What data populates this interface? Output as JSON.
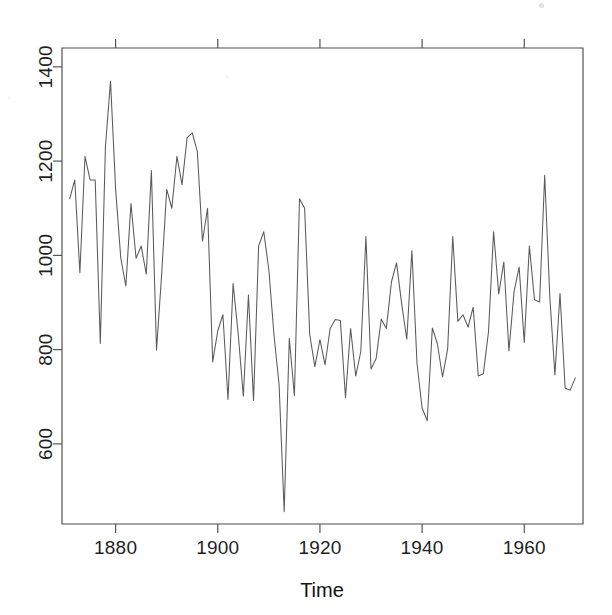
{
  "figure": {
    "background_color": "#ffffff",
    "line_color": "#5a5a5a",
    "axis_color": "#4d4d4d",
    "text_color": "#1a1a1a"
  },
  "chart_data": {
    "type": "line",
    "title": "",
    "subtitle": "",
    "xlabel": "Time",
    "ylabel": "",
    "xlim": [
      1869.5,
      1971.5
    ],
    "ylim": [
      430,
      1440
    ],
    "grid": false,
    "legend": false,
    "legend_position": "none",
    "xticks": [
      1880,
      1900,
      1920,
      1940,
      1960
    ],
    "xtick_labels": [
      "1880",
      "1900",
      "1920",
      "1940",
      "1960"
    ],
    "yticks": [
      600,
      800,
      1000,
      1200,
      1400
    ],
    "ytick_labels": [
      "600",
      "800",
      "1000",
      "1200",
      "1400"
    ],
    "series_name": "Nile annual flow",
    "x": [
      1871,
      1872,
      1873,
      1874,
      1875,
      1876,
      1877,
      1878,
      1879,
      1880,
      1881,
      1882,
      1883,
      1884,
      1885,
      1886,
      1887,
      1888,
      1889,
      1890,
      1891,
      1892,
      1893,
      1894,
      1895,
      1896,
      1897,
      1898,
      1899,
      1900,
      1901,
      1902,
      1903,
      1904,
      1905,
      1906,
      1907,
      1908,
      1909,
      1910,
      1911,
      1912,
      1913,
      1914,
      1915,
      1916,
      1917,
      1918,
      1919,
      1920,
      1921,
      1922,
      1923,
      1924,
      1925,
      1926,
      1927,
      1928,
      1929,
      1930,
      1931,
      1932,
      1933,
      1934,
      1935,
      1936,
      1937,
      1938,
      1939,
      1940,
      1941,
      1942,
      1943,
      1944,
      1945,
      1946,
      1947,
      1948,
      1949,
      1950,
      1951,
      1952,
      1953,
      1954,
      1955,
      1956,
      1957,
      1958,
      1959,
      1960,
      1961,
      1962,
      1963,
      1964,
      1965,
      1966,
      1967,
      1968,
      1969,
      1970
    ],
    "values": [
      1120,
      1160,
      963,
      1210,
      1160,
      1160,
      813,
      1230,
      1370,
      1140,
      995,
      935,
      1110,
      994,
      1020,
      960,
      1180,
      799,
      958,
      1140,
      1100,
      1210,
      1150,
      1250,
      1260,
      1220,
      1030,
      1100,
      774,
      840,
      874,
      694,
      940,
      833,
      701,
      916,
      692,
      1020,
      1050,
      969,
      831,
      726,
      456,
      824,
      702,
      1120,
      1100,
      832,
      764,
      821,
      768,
      845,
      864,
      862,
      698,
      845,
      744,
      796,
      1040,
      759,
      781,
      865,
      845,
      944,
      984,
      897,
      822,
      1010,
      771,
      676,
      649,
      846,
      812,
      742,
      801,
      1040,
      860,
      874,
      848,
      890,
      744,
      749,
      838,
      1050,
      918,
      986,
      797,
      923,
      975,
      815,
      1020,
      906,
      901,
      1170,
      912,
      746,
      919,
      718,
      714,
      740
    ],
    "units": "10^8 m^3",
    "n_points": 100
  },
  "axes": {
    "x_axis_title": "Time",
    "box_border": true,
    "ticks_outward": true
  }
}
